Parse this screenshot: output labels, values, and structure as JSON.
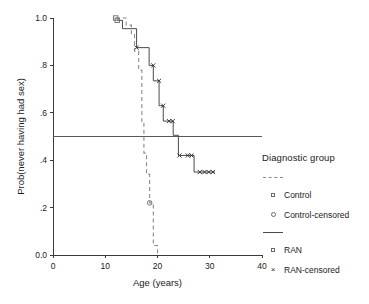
{
  "chart_data": {
    "type": "line",
    "title": "",
    "xlabel": "Age (years)",
    "ylabel": "Prob(never having had sex)",
    "xlim": [
      0,
      40
    ],
    "ylim": [
      0.0,
      1.0
    ],
    "xticks": [
      0,
      10,
      20,
      30,
      40
    ],
    "xtick_labels": [
      "0",
      "10",
      "20",
      "30",
      "40"
    ],
    "yticks": [
      0.0,
      0.2,
      0.4,
      0.6,
      0.8,
      1.0
    ],
    "ytick_labels": [
      "0.0",
      ".2",
      ".4",
      ".6",
      ".8",
      "1.0"
    ],
    "grid": false,
    "legend_position": "right",
    "reference_lines": [
      {
        "name": "median-reference-line",
        "orientation": "horizontal",
        "y": 0.5
      }
    ],
    "series": [
      {
        "name": "Control",
        "style": "dashed",
        "color": "#8a8a8a",
        "step": "post",
        "points": [
          {
            "x": 12.0,
            "y": 1.0
          },
          {
            "x": 14.0,
            "y": 1.0
          },
          {
            "x": 14.0,
            "y": 0.97
          },
          {
            "x": 15.0,
            "y": 0.97
          },
          {
            "x": 15.0,
            "y": 0.93
          },
          {
            "x": 15.6,
            "y": 0.93
          },
          {
            "x": 15.6,
            "y": 0.86
          },
          {
            "x": 16.4,
            "y": 0.86
          },
          {
            "x": 16.4,
            "y": 0.78
          },
          {
            "x": 17.0,
            "y": 0.78
          },
          {
            "x": 17.0,
            "y": 0.56
          },
          {
            "x": 17.4,
            "y": 0.56
          },
          {
            "x": 17.4,
            "y": 0.5
          },
          {
            "x": 17.4,
            "y": 0.43
          },
          {
            "x": 17.9,
            "y": 0.43
          },
          {
            "x": 17.9,
            "y": 0.34
          },
          {
            "x": 18.5,
            "y": 0.34
          },
          {
            "x": 18.5,
            "y": 0.22
          },
          {
            "x": 19.2,
            "y": 0.22
          },
          {
            "x": 19.2,
            "y": 0.04
          },
          {
            "x": 20.0,
            "y": 0.04
          },
          {
            "x": 20.0,
            "y": 0.0
          }
        ],
        "censored_marker": "circle",
        "censored_points": [
          {
            "x": 18.5,
            "y": 0.22
          }
        ]
      },
      {
        "name": "RAN",
        "style": "solid",
        "color": "#4a4a4a",
        "step": "post",
        "points": [
          {
            "x": 12.3,
            "y": 0.99
          },
          {
            "x": 13.3,
            "y": 0.99
          },
          {
            "x": 13.3,
            "y": 0.955
          },
          {
            "x": 16.0,
            "y": 0.955
          },
          {
            "x": 16.0,
            "y": 0.875
          },
          {
            "x": 18.4,
            "y": 0.875
          },
          {
            "x": 18.4,
            "y": 0.8
          },
          {
            "x": 19.2,
            "y": 0.8
          },
          {
            "x": 19.2,
            "y": 0.735
          },
          {
            "x": 20.3,
            "y": 0.735
          },
          {
            "x": 20.3,
            "y": 0.63
          },
          {
            "x": 21.1,
            "y": 0.63
          },
          {
            "x": 21.1,
            "y": 0.565
          },
          {
            "x": 23.0,
            "y": 0.565
          },
          {
            "x": 23.0,
            "y": 0.505
          },
          {
            "x": 24.0,
            "y": 0.505
          },
          {
            "x": 24.0,
            "y": 0.42
          },
          {
            "x": 27.0,
            "y": 0.42
          },
          {
            "x": 27.0,
            "y": 0.35
          },
          {
            "x": 31.0,
            "y": 0.35
          }
        ],
        "censored_marker": "cross",
        "censored_points": [
          {
            "x": 16.0,
            "y": 0.875
          },
          {
            "x": 19.2,
            "y": 0.8
          },
          {
            "x": 20.3,
            "y": 0.735
          },
          {
            "x": 21.1,
            "y": 0.63
          },
          {
            "x": 22.2,
            "y": 0.565
          },
          {
            "x": 22.9,
            "y": 0.565
          },
          {
            "x": 24.2,
            "y": 0.42
          },
          {
            "x": 25.8,
            "y": 0.42
          },
          {
            "x": 26.5,
            "y": 0.42
          },
          {
            "x": 28.1,
            "y": 0.35
          },
          {
            "x": 29.0,
            "y": 0.35
          },
          {
            "x": 29.8,
            "y": 0.35
          },
          {
            "x": 30.6,
            "y": 0.35
          }
        ]
      }
    ]
  },
  "legend": {
    "title": "Diagnostic group",
    "items": [
      {
        "key": "dashed-line",
        "label": ""
      },
      {
        "key": "square-marker",
        "label": "Control"
      },
      {
        "key": "circle-marker",
        "label": "Control-censored"
      },
      {
        "key": "solid-line",
        "label": ""
      },
      {
        "key": "square-marker",
        "label": "RAN"
      },
      {
        "key": "cross-marker",
        "label": "RAN-censored"
      }
    ]
  },
  "colors": {
    "control": "#8a8a8a",
    "ran": "#4a4a4a",
    "axis": "#3a3a3a",
    "reference": "#5a5a5a",
    "background": "#ffffff"
  }
}
